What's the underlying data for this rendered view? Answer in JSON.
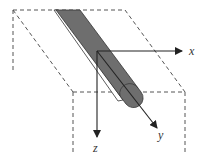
{
  "diagram": {
    "type": "3d-coordinate-schematic",
    "colors": {
      "outline": "#555555",
      "rod_fill": "#6e6e6e",
      "rod_edge": "#333333",
      "axis": "#222222",
      "background": "#ffffff"
    },
    "axes": [
      {
        "id": "x",
        "label": "x",
        "direction": "right"
      },
      {
        "id": "y",
        "label": "y",
        "direction": "diagonal-down-right"
      },
      {
        "id": "z",
        "label": "z",
        "direction": "down"
      }
    ],
    "elements": [
      {
        "id": "plane",
        "style": "dashed",
        "shape": "parallelogram"
      },
      {
        "id": "box-lower",
        "style": "dashed",
        "shape": "open-box"
      },
      {
        "id": "rod",
        "style": "filled",
        "shape": "rounded-cylinder"
      }
    ]
  }
}
